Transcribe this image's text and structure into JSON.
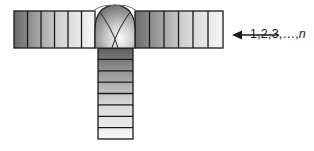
{
  "figure": {
    "type": "t-joint-weld-cross-section",
    "title": "",
    "background_color": "#ffffff",
    "outline_color": "#1a1a1a",
    "annotation": {
      "arrow": {
        "name": "segment-numbering-arrow",
        "direction": "left",
        "tail_x": 279,
        "tip_x": 232,
        "y": 35
      },
      "label": {
        "prefix": "1,2,3,…,",
        "italic_symbol": "n",
        "full_text": "1,2,3,…,n",
        "x": 238,
        "y": 28
      }
    },
    "horizontal_plate": {
      "name": "horizontal-plate",
      "x": 14,
      "y": 11,
      "width": 209,
      "height": 37,
      "segment_count_left": 6,
      "segment_count_right": 6,
      "gradient": {
        "from": "#6e6e6e",
        "to": "#f2f2f2",
        "direction": "horizontal"
      }
    },
    "vertical_plate": {
      "name": "vertical-plate",
      "x": 98,
      "y": 48,
      "width": 35,
      "height": 91,
      "segment_count": 8,
      "gradient": {
        "from": "#5f5f5f",
        "to": "#f4f4f4",
        "direction": "vertical"
      }
    },
    "weld_bead": {
      "name": "weld-bead-dome",
      "center_x": 115,
      "apex_y": 5,
      "base_y": 48,
      "half_width": 20,
      "cross_lines": 2,
      "gradient": {
        "from": "#4a4a4a",
        "to": "#fafafa"
      }
    }
  }
}
